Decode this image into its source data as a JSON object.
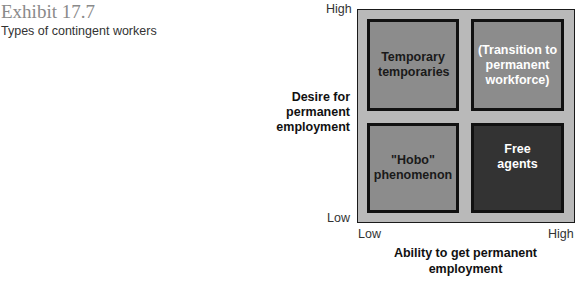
{
  "exhibit": {
    "number": "Exhibit 17.7",
    "title": "Types of contingent workers"
  },
  "diagram": {
    "y_axis": {
      "label": "Desire for permanent employment",
      "high": "High",
      "low": "Low"
    },
    "x_axis": {
      "label": "Ability to get permanent employment",
      "low": "Low",
      "high": "High"
    },
    "quadrants": {
      "top_left": "Temporary temporaries",
      "top_right": "(Transition to permanent workforce)",
      "bottom_left": "\"Hobo\" phenomenon",
      "bottom_right": "Free agents"
    },
    "colors": {
      "outer_bg": "#b9b9b9",
      "quadrant_mid": "#8c8c8c",
      "quadrant_dark": "#333333"
    }
  }
}
